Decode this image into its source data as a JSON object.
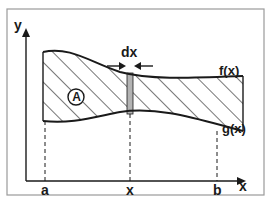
{
  "diagram": {
    "axes": {
      "y_label": "y",
      "x_label": "x"
    },
    "curves": {
      "upper_label": "f(x)",
      "lower_label": "g(x)"
    },
    "region_label": "A",
    "strip_label": "dx",
    "x_ticks": {
      "a": "a",
      "x": "x",
      "b": "b"
    },
    "colors": {
      "line": "#1a1a1a",
      "strip_fill": "#b3b3b3",
      "border": "#9a9a9a",
      "background": "#ffffff"
    }
  }
}
